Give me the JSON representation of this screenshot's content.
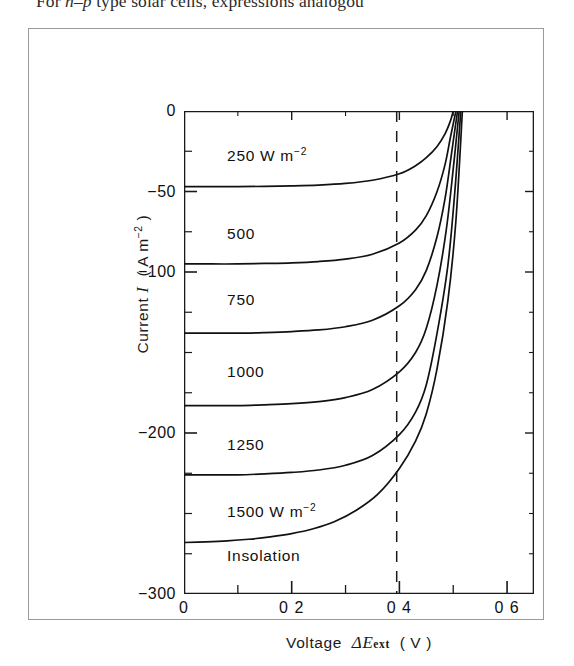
{
  "page": {
    "body_text_before": "For ",
    "body_text_italic_n": "n",
    "body_text_dash": "–",
    "body_text_italic_p": "p",
    "body_text_after": " type solar cells, expressions analogou"
  },
  "figure": {
    "x_axis_title_prefix": "Voltage",
    "x_axis_symbol_delta": "Δ",
    "x_axis_symbol_E": "E",
    "x_axis_symbol_sub": "ext",
    "x_axis_units": "( V )",
    "y_axis_title_prefix": "Current",
    "y_axis_symbol": "I",
    "y_axis_units_open": "( A m",
    "y_axis_units_exp": "−2",
    "y_axis_units_close": " )"
  },
  "chart_data": {
    "type": "line",
    "title": "",
    "xlabel": "Voltage ΔE_ext ( V )",
    "ylabel": "Current I ( A m−2 )",
    "xlim": [
      0,
      0.65
    ],
    "ylim": [
      -300,
      0
    ],
    "grid": false,
    "legend": "inline-curve-labels",
    "x_ticks_major": [
      0,
      0.2,
      0.4,
      0.6
    ],
    "x_tick_labels": [
      "0",
      "0 2",
      "0 4",
      "0 6"
    ],
    "x_ticks_minor": [
      0.1,
      0.3,
      0.5
    ],
    "y_ticks_major": [
      0,
      -50,
      -100,
      -200,
      -300
    ],
    "y_tick_labels": [
      "0",
      "−50",
      "−100",
      "−200",
      "−300"
    ],
    "y_ticks_minor": [
      -25,
      -75,
      -125,
      -150,
      -175,
      -225,
      -250,
      -275
    ],
    "annotations": [
      {
        "text": "250 W m",
        "exp": "−2",
        "x": 0.08,
        "y": -28
      },
      {
        "text": "500",
        "exp": "",
        "x": 0.08,
        "y": -77
      },
      {
        "text": "750",
        "exp": "",
        "x": 0.08,
        "y": -118
      },
      {
        "text": "1000",
        "exp": "",
        "x": 0.08,
        "y": -163
      },
      {
        "text": "1250",
        "exp": "",
        "x": 0.08,
        "y": -208
      },
      {
        "text": "1500 W m",
        "exp": "−2",
        "x": 0.08,
        "y": -249
      },
      {
        "text": "Insolation",
        "exp": "",
        "x": 0.08,
        "y": -277
      }
    ],
    "marker_line": {
      "type": "vertical-dashed",
      "x": 0.395,
      "y_from": 0,
      "y_to": -300
    },
    "series": [
      {
        "name": "250 W m-2",
        "insolation": 250,
        "short_circuit_current": -47,
        "open_circuit_voltage": 0.5,
        "points": [
          [
            0,
            -47
          ],
          [
            0.05,
            -47
          ],
          [
            0.1,
            -47
          ],
          [
            0.15,
            -46.8
          ],
          [
            0.2,
            -46.5
          ],
          [
            0.25,
            -46
          ],
          [
            0.3,
            -45
          ],
          [
            0.35,
            -43
          ],
          [
            0.4,
            -39
          ],
          [
            0.43,
            -34
          ],
          [
            0.45,
            -29
          ],
          [
            0.47,
            -22
          ],
          [
            0.485,
            -14
          ],
          [
            0.495,
            -6
          ],
          [
            0.5,
            0
          ]
        ]
      },
      {
        "name": "500",
        "insolation": 500,
        "short_circuit_current": -95,
        "open_circuit_voltage": 0.505,
        "points": [
          [
            0,
            -95
          ],
          [
            0.05,
            -95
          ],
          [
            0.1,
            -95
          ],
          [
            0.15,
            -94.7
          ],
          [
            0.2,
            -94.3
          ],
          [
            0.25,
            -93.5
          ],
          [
            0.3,
            -92
          ],
          [
            0.35,
            -89
          ],
          [
            0.4,
            -82
          ],
          [
            0.43,
            -74
          ],
          [
            0.45,
            -65
          ],
          [
            0.47,
            -50
          ],
          [
            0.485,
            -33
          ],
          [
            0.495,
            -16
          ],
          [
            0.505,
            0
          ]
        ]
      },
      {
        "name": "750",
        "insolation": 750,
        "short_circuit_current": -138,
        "open_circuit_voltage": 0.508,
        "points": [
          [
            0,
            -138
          ],
          [
            0.05,
            -138
          ],
          [
            0.1,
            -138
          ],
          [
            0.15,
            -137.6
          ],
          [
            0.2,
            -137
          ],
          [
            0.25,
            -136
          ],
          [
            0.3,
            -134
          ],
          [
            0.35,
            -130
          ],
          [
            0.4,
            -121
          ],
          [
            0.43,
            -111
          ],
          [
            0.45,
            -99
          ],
          [
            0.47,
            -78
          ],
          [
            0.485,
            -54
          ],
          [
            0.497,
            -26
          ],
          [
            0.508,
            0
          ]
        ]
      },
      {
        "name": "1000",
        "insolation": 1000,
        "short_circuit_current": -183,
        "open_circuit_voltage": 0.511,
        "points": [
          [
            0,
            -183
          ],
          [
            0.05,
            -183
          ],
          [
            0.1,
            -183
          ],
          [
            0.15,
            -182.5
          ],
          [
            0.2,
            -181.8
          ],
          [
            0.25,
            -180.5
          ],
          [
            0.3,
            -178
          ],
          [
            0.35,
            -173
          ],
          [
            0.4,
            -162
          ],
          [
            0.43,
            -150
          ],
          [
            0.45,
            -135
          ],
          [
            0.47,
            -108
          ],
          [
            0.487,
            -74
          ],
          [
            0.5,
            -36
          ],
          [
            0.511,
            0
          ]
        ]
      },
      {
        "name": "1250",
        "insolation": 1250,
        "short_circuit_current": -226,
        "open_circuit_voltage": 0.514,
        "points": [
          [
            0,
            -226
          ],
          [
            0.05,
            -226
          ],
          [
            0.1,
            -226
          ],
          [
            0.15,
            -225.4
          ],
          [
            0.2,
            -224.5
          ],
          [
            0.25,
            -223
          ],
          [
            0.3,
            -220
          ],
          [
            0.35,
            -214
          ],
          [
            0.4,
            -201
          ],
          [
            0.43,
            -187
          ],
          [
            0.45,
            -170
          ],
          [
            0.47,
            -138
          ],
          [
            0.49,
            -96
          ],
          [
            0.503,
            -50
          ],
          [
            0.514,
            0
          ]
        ]
      },
      {
        "name": "1500 W m-2",
        "insolation": 1500,
        "short_circuit_current": -268,
        "open_circuit_voltage": 0.517,
        "points": [
          [
            0,
            -268
          ],
          [
            0.04,
            -267.6
          ],
          [
            0.08,
            -267
          ],
          [
            0.12,
            -266
          ],
          [
            0.16,
            -264.5
          ],
          [
            0.2,
            -262.5
          ],
          [
            0.24,
            -259.5
          ],
          [
            0.28,
            -255
          ],
          [
            0.32,
            -248
          ],
          [
            0.36,
            -238
          ],
          [
            0.4,
            -222
          ],
          [
            0.43,
            -205
          ],
          [
            0.45,
            -188
          ],
          [
            0.47,
            -160
          ],
          [
            0.49,
            -118
          ],
          [
            0.505,
            -68
          ],
          [
            0.517,
            0
          ]
        ]
      }
    ]
  }
}
